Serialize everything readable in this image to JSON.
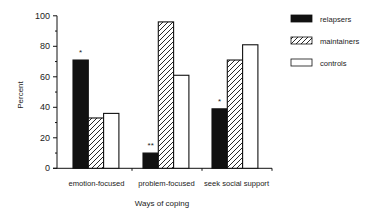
{
  "chart_data": {
    "type": "bar",
    "title": "",
    "xlabel": "Ways of coping",
    "ylabel": "Percent",
    "ylim": [
      0,
      100
    ],
    "yticks": [
      0,
      20,
      40,
      60,
      80,
      100
    ],
    "grid": false,
    "legend_position": "upper right",
    "categories": [
      "emotion-focused",
      "problem-focused",
      "seek social support"
    ],
    "series": [
      {
        "name": "relapsers",
        "fill": "solid-black",
        "values": [
          71,
          10,
          39
        ]
      },
      {
        "name": "maintainers",
        "fill": "diagonal-hatch",
        "values": [
          33,
          96,
          71
        ]
      },
      {
        "name": "controls",
        "fill": "white",
        "values": [
          36,
          61,
          81
        ]
      }
    ],
    "annotations": [
      {
        "category": "emotion-focused",
        "series": "relapsers",
        "text": "*"
      },
      {
        "category": "problem-focused",
        "series": "relapsers",
        "text": "**"
      },
      {
        "category": "seek social support",
        "series": "relapsers",
        "text": "*"
      }
    ]
  },
  "colors": {
    "ink": "#111111",
    "background": "#ffffff"
  }
}
